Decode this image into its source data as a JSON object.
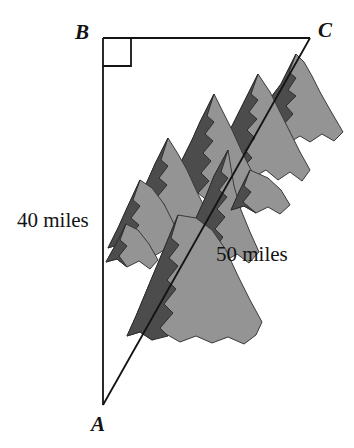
{
  "figure": {
    "kind": "right-triangle-with-mountains",
    "background_color": "#ffffff",
    "line_color": "#131313",
    "vertices": {
      "a": {
        "label": "A",
        "x": 103,
        "y": 405
      },
      "b": {
        "label": "B",
        "x": 103,
        "y": 38
      },
      "c": {
        "label": "C",
        "x": 310,
        "y": 38
      }
    },
    "right_angle": {
      "at_vertex": "B",
      "marker_size": 28
    },
    "sides": [
      {
        "name": "AB",
        "label": "40 miles",
        "value": 40,
        "unit": "miles",
        "orientation": "vertical-left"
      },
      {
        "name": "AC",
        "label": "50 miles",
        "value": 50,
        "unit": "miles",
        "orientation": "hypotenuse"
      },
      {
        "name": "BC",
        "label": "",
        "value": null,
        "unit": "miles",
        "orientation": "horizontal-top"
      }
    ],
    "labels": {
      "vertex_a": "A",
      "vertex_b": "B",
      "vertex_c": "C",
      "leg_ab": "40 miles",
      "hypotenuse_ac": "50 miles"
    },
    "mountains": {
      "name": "mountain-range-illustration",
      "shadow_color": "#4c4c4c",
      "sunlit_color": "#949494",
      "outline_color": "#2a2a2a"
    }
  }
}
